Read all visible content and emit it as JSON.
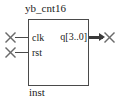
{
  "symbol": {
    "module_name": "yb_cnt16",
    "instance_name": "inst",
    "border_color": "#4a4a4a",
    "text_color": "#1a1a1a",
    "wire_color": "#4a4a4a",
    "bus_color": "#3a3a3a",
    "background": "#ffffff"
  },
  "ports": {
    "inputs": [
      {
        "label": "clk",
        "type": "input",
        "width": 1,
        "marker": "x-pin-marker"
      },
      {
        "label": "rst",
        "type": "input",
        "width": 1,
        "marker": "x-pin-marker"
      }
    ],
    "outputs": [
      {
        "label": "q[3..0]",
        "type": "output",
        "width": 4,
        "marker": "x-pin-marker",
        "bus": true
      }
    ]
  }
}
